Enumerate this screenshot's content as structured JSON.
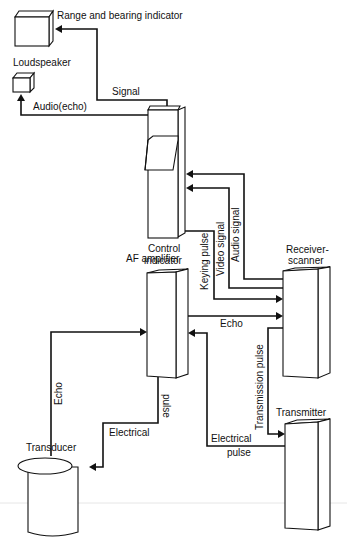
{
  "diagram": {
    "type": "block diagram",
    "colors": {
      "ink": "#111111",
      "background": "#ffffff"
    },
    "components": {
      "range_bearing": "Range and bearing indicator",
      "loudspeaker": "Loudspeaker",
      "control_line1": "Control",
      "control_line2": "indicator",
      "af_amplifier": "AF amplifier",
      "receiver_line1": "Receiver-",
      "receiver_line2": "scanner",
      "transmitter": "Transmitter",
      "transducer": "Transducer"
    },
    "signals": {
      "signal": "Signal",
      "audio_echo": "Audio(echo)",
      "keying_pulse": "Keying pulse",
      "video_signal": "Video signal",
      "audio_signal": "Audio signal",
      "echo_af_receiver": "Echo",
      "echo_transducer_af": "Echo",
      "transmission_pulse": "Transmission pulse",
      "electrical_pulse_af_word1": "Electrical",
      "electrical_pulse_af_word2": "pulse",
      "electrical_pulse_tx_word1": "Electrical",
      "electrical_pulse_tx_word2": "pulse"
    },
    "connections": [
      {
        "from": "Control indicator",
        "to": "Range and bearing indicator",
        "label": "Signal"
      },
      {
        "from": "Control indicator",
        "to": "Loudspeaker",
        "label": "Audio(echo)"
      },
      {
        "from": "Receiver-scanner",
        "to": "Control indicator",
        "label": "Audio signal"
      },
      {
        "from": "Receiver-scanner",
        "to": "Control indicator",
        "label": "Video signal"
      },
      {
        "from": "Control indicator",
        "to": "Receiver-scanner",
        "label": "Keying pulse"
      },
      {
        "from": "AF amplifier",
        "to": "Receiver-scanner",
        "label": "Echo"
      },
      {
        "from": "Receiver-scanner",
        "to": "Transmitter",
        "label": "Transmission pulse"
      },
      {
        "from": "Transmitter",
        "to": "AF amplifier",
        "label": "Electrical pulse"
      },
      {
        "from": "AF amplifier",
        "to": "Transducer",
        "label": "Electrical pulse"
      },
      {
        "from": "Transducer",
        "to": "AF amplifier",
        "label": "Echo"
      }
    ]
  }
}
